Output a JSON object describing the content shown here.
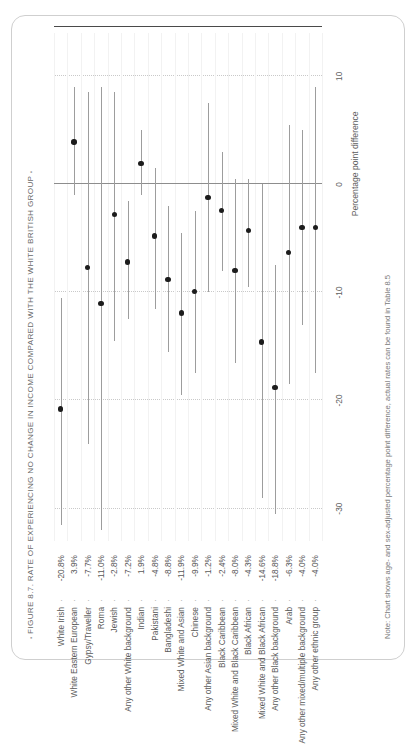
{
  "figure": {
    "title": "FIGURE 8.7. RATE OF EXPERIENCING NO CHANGE IN INCOME COMPARED WITH THE WHITE BRITISH GROUP",
    "bullet_left": "▪",
    "bullet_right": "▪",
    "note": "Note: Chart shows age- and sex-adjusted percentage point difference, actual rates can be found in Table 8.5",
    "value_separator": "·"
  },
  "chart_data": {
    "type": "scatter",
    "title": "FIGURE 8.7. RATE OF EXPERIENCING NO CHANGE IN INCOME COMPARED WITH THE WHITE BRITISH GROUP",
    "orientation": "vertical-categories-with-horizontal-value-axis",
    "xlabel": "Percentage point difference",
    "ylabel": "",
    "xlim": [
      -33,
      14
    ],
    "xticks": [
      -30,
      -20,
      -10,
      0,
      10
    ],
    "xticklabels": [
      "-30",
      "-20",
      "-10",
      "0",
      "10"
    ],
    "grid": "dotted vertical gridlines at each tick; solid reference line at 0",
    "legend": "none",
    "categories": [
      "White Irish",
      "White Eastern European",
      "Gypsy/Traveller",
      "Roma",
      "Jewish",
      "Any other White background",
      "Indian",
      "Pakistani",
      "Bangladeshi",
      "Mixed White and Asian",
      "Chinese",
      "Any other Asian background",
      "Black Caribbean",
      "Mixed White and Black Caribbean",
      "Black African",
      "Mixed White and Black African",
      "Any other Black background",
      "Arab",
      "Any other mixed/multiple background",
      "Any other ethnic group"
    ],
    "value_labels": [
      "-20.8%",
      "3.9%",
      "-7.7%",
      "-11.0%",
      "-2.8%",
      "-7.2%",
      "1.9%",
      "-4.8%",
      "-8.8%",
      "-11.9%",
      "-9.9%",
      "-1.2%",
      "-2.4%",
      "-8.0%",
      "-4.3%",
      "-14.6%",
      "-18.8%",
      "-6.3%",
      "-4.0%",
      "-4.0%"
    ],
    "values": [
      -20.8,
      3.9,
      -7.7,
      -11.0,
      -2.8,
      -7.2,
      1.9,
      -4.8,
      -8.8,
      -11.9,
      -9.9,
      -1.2,
      -2.4,
      -8.0,
      -4.3,
      -14.6,
      -18.8,
      -6.3,
      -4.0,
      -4.0
    ],
    "ci_low": [
      -31.5,
      -1.0,
      -24.0,
      -32.0,
      -14.5,
      -12.5,
      -1.0,
      -11.5,
      -15.5,
      -19.5,
      -17.5,
      -10.0,
      -8.0,
      -16.5,
      -9.5,
      -29.0,
      -30.5,
      -18.5,
      -13.0,
      -17.5
    ],
    "ci_high": [
      -10.5,
      9.0,
      8.5,
      9.0,
      8.5,
      -1.5,
      5.0,
      1.5,
      -2.0,
      -4.5,
      -2.5,
      7.5,
      3.0,
      0.5,
      0.5,
      0.0,
      -7.5,
      5.5,
      5.0,
      9.0
    ]
  }
}
